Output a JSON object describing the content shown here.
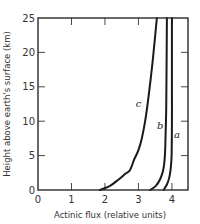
{
  "chart_data": {
    "type": "line",
    "title": "",
    "xlabel": "Actinic flux (relative units)",
    "ylabel": "Height above earth's surface (km)",
    "xlim": [
      0,
      4.48
    ],
    "ylim": [
      0,
      25
    ],
    "x_ticks": [
      0,
      1,
      2,
      3,
      4
    ],
    "y_ticks": [
      0,
      5,
      10,
      15,
      20,
      25
    ],
    "x_tick_labels": [
      "0",
      "1",
      "2",
      "3",
      "4"
    ],
    "y_tick_labels": [
      "0",
      "5",
      "10",
      "15",
      "20",
      "25"
    ],
    "grid": false,
    "legend": "none (curves labeled inline)",
    "series": [
      {
        "name": "a",
        "points": [
          [
            3.75,
            0
          ],
          [
            3.85,
            0.8
          ],
          [
            3.92,
            1.8
          ],
          [
            3.96,
            3
          ],
          [
            3.99,
            5
          ],
          [
            4.0,
            10
          ],
          [
            4.0,
            15
          ],
          [
            4.0,
            20
          ],
          [
            4.0,
            25
          ]
        ],
        "label_pos": [
          4.15,
          7.5
        ]
      },
      {
        "name": "b",
        "points": [
          [
            3.35,
            0
          ],
          [
            3.52,
            0.6
          ],
          [
            3.65,
            1.6
          ],
          [
            3.74,
            2.9
          ],
          [
            3.79,
            5
          ],
          [
            3.81,
            8
          ],
          [
            3.83,
            12
          ],
          [
            3.84,
            18
          ],
          [
            3.85,
            25
          ]
        ],
        "label_pos": [
          3.65,
          8.9
        ]
      },
      {
        "name": "c",
        "points": [
          [
            1.85,
            0
          ],
          [
            2.15,
            0.6
          ],
          [
            2.4,
            1.5
          ],
          [
            2.62,
            2.4
          ],
          [
            2.75,
            2.9
          ],
          [
            2.87,
            4.4
          ],
          [
            3.0,
            5.8
          ],
          [
            3.1,
            7.5
          ],
          [
            3.2,
            10
          ],
          [
            3.3,
            13.5
          ],
          [
            3.42,
            18.5
          ],
          [
            3.55,
            25
          ]
        ],
        "label_pos": [
          3.0,
          12
        ]
      }
    ],
    "annotations": [
      "a",
      "b",
      "c"
    ]
  }
}
